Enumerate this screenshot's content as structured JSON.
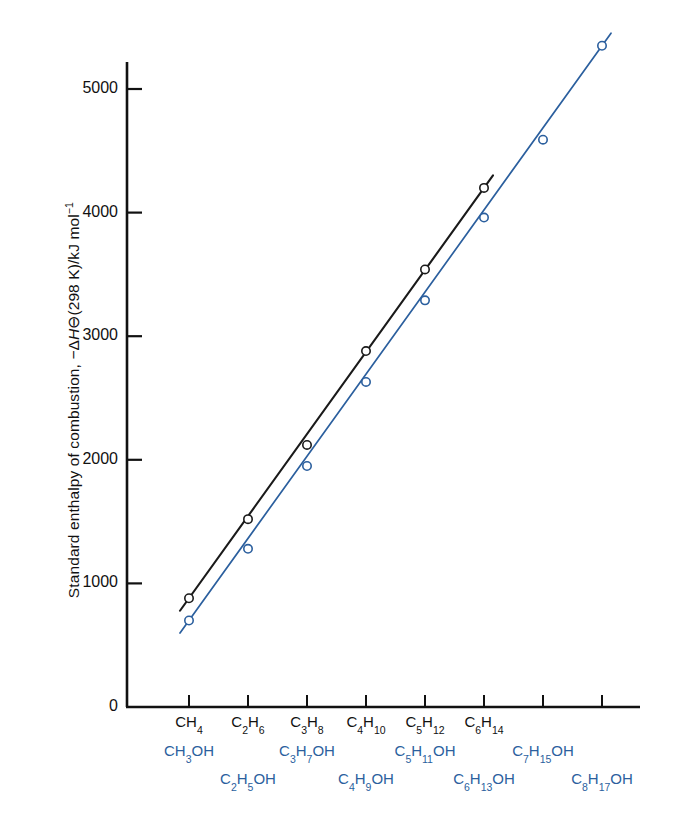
{
  "chart_data": {
    "type": "scatter",
    "title": "",
    "xlabel": "",
    "ylabel": "Standard enthalpy of combustion, −ΔH⊖(298 K)/kJ mol⁻¹",
    "ylabel_parts": {
      "prefix": "Standard enthalpy of combustion,  −Δ",
      "italic": "H",
      "symbol": "⊖",
      "suffix": "(298 K)/kJ mol",
      "exponent": "−1"
    },
    "ylim": [
      0,
      5500
    ],
    "yticks": [
      0,
      1000,
      2000,
      3000,
      4000,
      5000
    ],
    "ytick_labels": [
      "0",
      "1000",
      "2000",
      "3000",
      "4000",
      "5000"
    ],
    "xlim": [
      0.5,
      8.5
    ],
    "xticks": [
      1,
      2,
      3,
      4,
      5,
      6,
      7,
      8
    ],
    "grid": false,
    "legend": "none",
    "series": [
      {
        "name": "alkanes",
        "color": "#1a1a1a",
        "marker": "open-circle",
        "categories": [
          "CH4",
          "C2H6",
          "C3H8",
          "C4H10",
          "C5H12",
          "C6H14"
        ],
        "x": [
          1,
          2,
          3,
          4,
          5,
          6
        ],
        "values": [
          880,
          1520,
          2120,
          2880,
          3540,
          4200
        ]
      },
      {
        "name": "alcohols",
        "color": "#2b5f9e",
        "marker": "open-circle",
        "categories": [
          "CH3OH",
          "C2H5OH",
          "C3H7OH",
          "C4H9OH",
          "C5H11OH",
          "C6H13OH",
          "C7H15OH",
          "C8H17OH"
        ],
        "x": [
          1,
          2,
          3,
          4,
          5,
          6,
          7,
          8
        ],
        "values": [
          700,
          1280,
          1950,
          2630,
          3290,
          3960,
          4590,
          5350
        ]
      }
    ],
    "xaxis_rows": [
      {
        "name": "alkane-row",
        "color": "#111111",
        "items": [
          {
            "base": "CH",
            "sub": "4",
            "base2": "",
            "sub2": "",
            "tail": "",
            "x": 1
          },
          {
            "base": "C",
            "sub": "2",
            "base2": "H",
            "sub2": "6",
            "tail": "",
            "x": 2
          },
          {
            "base": "C",
            "sub": "3",
            "base2": "H",
            "sub2": "8",
            "tail": "",
            "x": 3
          },
          {
            "base": "C",
            "sub": "4",
            "base2": "H",
            "sub2": "10",
            "tail": "",
            "x": 4
          },
          {
            "base": "C",
            "sub": "5",
            "base2": "H",
            "sub2": "12",
            "tail": "",
            "x": 5
          },
          {
            "base": "C",
            "sub": "6",
            "base2": "H",
            "sub2": "14",
            "tail": "",
            "x": 6
          }
        ]
      },
      {
        "name": "alcohol-odd-row",
        "color": "#2b5f9e",
        "items": [
          {
            "base": "CH",
            "sub": "3",
            "base2": "",
            "sub2": "",
            "tail": "OH",
            "x": 1
          },
          {
            "base": "C",
            "sub": "3",
            "base2": "H",
            "sub2": "7",
            "tail": "OH",
            "x": 3
          },
          {
            "base": "C",
            "sub": "5",
            "base2": "H",
            "sub2": "11",
            "tail": "OH",
            "x": 5
          },
          {
            "base": "C",
            "sub": "7",
            "base2": "H",
            "sub2": "15",
            "tail": "OH",
            "x": 7
          }
        ]
      },
      {
        "name": "alcohol-even-row",
        "color": "#2b5f9e",
        "items": [
          {
            "base": "C",
            "sub": "2",
            "base2": "H",
            "sub2": "5",
            "tail": "OH",
            "x": 2
          },
          {
            "base": "C",
            "sub": "4",
            "base2": "H",
            "sub2": "9",
            "tail": "OH",
            "x": 4
          },
          {
            "base": "C",
            "sub": "6",
            "base2": "H",
            "sub2": "13",
            "tail": "OH",
            "x": 6
          },
          {
            "base": "C",
            "sub": "8",
            "base2": "H",
            "sub2": "17",
            "tail": "OH",
            "x": 8
          }
        ]
      }
    ]
  },
  "colors": {
    "background": "#ffffff",
    "axis": "#111111",
    "alkane_series": "#1a1a1a",
    "alcohol_series": "#2b5f9e"
  }
}
